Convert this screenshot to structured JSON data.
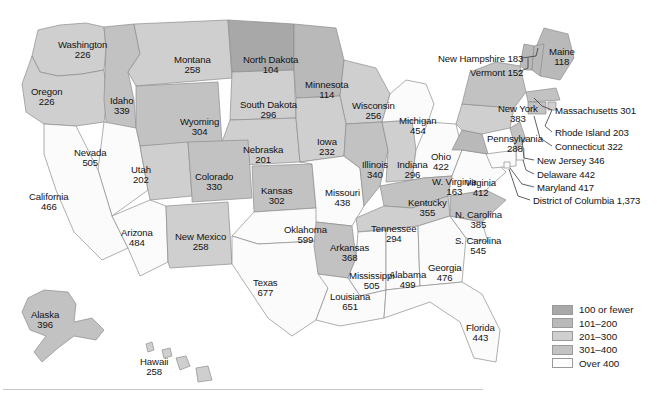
{
  "map": {
    "title": "United States choropleth map of state values",
    "bands": {
      "b1": {
        "key": "b1",
        "label": "100 or fewer",
        "color": "#a8a8a8"
      },
      "b2": {
        "key": "b2",
        "label": "101–200",
        "color": "#b9b9b9"
      },
      "b3": {
        "key": "b3",
        "label": "201–300",
        "color": "#cfcfcf"
      },
      "b4": {
        "key": "b4",
        "label": "301–400",
        "color": "#c2c2c2"
      },
      "b5": {
        "key": "b5",
        "label": "Over 400",
        "color": "#fdfdfd"
      }
    },
    "states": [
      {
        "id": "WA",
        "name": "Washington",
        "value": "226",
        "band": "b3",
        "x": 58,
        "y": 40
      },
      {
        "id": "OR",
        "name": "Oregon",
        "value": "226",
        "band": "b3",
        "x": 31,
        "y": 87
      },
      {
        "id": "ID",
        "name": "Idaho",
        "value": "339",
        "band": "b4",
        "x": 110,
        "y": 96
      },
      {
        "id": "MT",
        "name": "Montana",
        "value": "258",
        "band": "b3",
        "x": 174,
        "y": 55
      },
      {
        "id": "WY",
        "name": "Wyoming",
        "value": "304",
        "band": "b4",
        "x": 180,
        "y": 117
      },
      {
        "id": "ND",
        "name": "North Dakota",
        "value": "104",
        "band": "b1",
        "x": 243,
        "y": 55
      },
      {
        "id": "SD",
        "name": "South Dakota",
        "value": "296",
        "band": "b3",
        "x": 240,
        "y": 100
      },
      {
        "id": "NE",
        "name": "Nebraska",
        "value": "201",
        "band": "b3",
        "x": 243,
        "y": 145
      },
      {
        "id": "MN",
        "name": "Minnesota",
        "value": "114",
        "band": "b2",
        "x": 305,
        "y": 80
      },
      {
        "id": "WI",
        "name": "Wisconsin",
        "value": "256",
        "band": "b3",
        "x": 352,
        "y": 101
      },
      {
        "id": "IA",
        "name": "Iowa",
        "value": "232",
        "band": "b3",
        "x": 317,
        "y": 137
      },
      {
        "id": "NV",
        "name": "Nevada",
        "value": "505",
        "band": "b5",
        "x": 74,
        "y": 148
      },
      {
        "id": "UT",
        "name": "Utah",
        "value": "202",
        "band": "b3",
        "x": 131,
        "y": 165
      },
      {
        "id": "CO",
        "name": "Colorado",
        "value": "330",
        "band": "b4",
        "x": 195,
        "y": 172
      },
      {
        "id": "KS",
        "name": "Kansas",
        "value": "302",
        "band": "b4",
        "x": 261,
        "y": 186
      },
      {
        "id": "CA",
        "name": "California",
        "value": "466",
        "band": "b5",
        "x": 29,
        "y": 192
      },
      {
        "id": "AZ",
        "name": "Arizona",
        "value": "484",
        "band": "b5",
        "x": 121,
        "y": 228
      },
      {
        "id": "NM",
        "name": "New Mexico",
        "value": "258",
        "band": "b3",
        "x": 175,
        "y": 232
      },
      {
        "id": "OK",
        "name": "Oklahoma",
        "value": "599",
        "band": "b5",
        "x": 284,
        "y": 225
      },
      {
        "id": "TX",
        "name": "Texas",
        "value": "677",
        "band": "b5",
        "x": 253,
        "y": 278
      },
      {
        "id": "MO",
        "name": "Missouri",
        "value": "438",
        "band": "b5",
        "x": 325,
        "y": 188
      },
      {
        "id": "IL",
        "name": "Illinois",
        "value": "340",
        "band": "b4",
        "x": 362,
        "y": 160
      },
      {
        "id": "IN",
        "name": "Indiana",
        "value": "296",
        "band": "b3",
        "x": 397,
        "y": 160
      },
      {
        "id": "MI",
        "name": "Michigan",
        "value": "454",
        "band": "b5",
        "x": 399,
        "y": 116
      },
      {
        "id": "OH",
        "name": "Ohio",
        "value": "422",
        "band": "b5",
        "x": 431,
        "y": 152
      },
      {
        "id": "AR",
        "name": "Arkansas",
        "value": "368",
        "band": "b4",
        "x": 330,
        "y": 243
      },
      {
        "id": "KY",
        "name": "Kentucky",
        "value": "355",
        "band": "b4",
        "x": 408,
        "y": 198
      },
      {
        "id": "TN",
        "name": "Tennessee",
        "value": "294",
        "band": "b3",
        "x": 371,
        "y": 224
      },
      {
        "id": "MS",
        "name": "Mississippi",
        "value": "505",
        "band": "b5",
        "x": 349,
        "y": 271
      },
      {
        "id": "AL",
        "name": "Alabama",
        "value": "499",
        "band": "b5",
        "x": 389,
        "y": 270
      },
      {
        "id": "LA",
        "name": "Louisiana",
        "value": "651",
        "band": "b5",
        "x": 330,
        "y": 292
      },
      {
        "id": "GA",
        "name": "Georgia",
        "value": "476",
        "band": "b5",
        "x": 428,
        "y": 263
      },
      {
        "id": "FL",
        "name": "Florida",
        "value": "443",
        "band": "b5",
        "x": 466,
        "y": 323
      },
      {
        "id": "SC",
        "name": "S. Carolina",
        "value": "545",
        "band": "b5",
        "x": 455,
        "y": 236
      },
      {
        "id": "NC",
        "name": "N. Carolina",
        "value": "385",
        "band": "b4",
        "x": 455,
        "y": 210
      },
      {
        "id": "VA",
        "name": "Virginia",
        "value": "412",
        "band": "b5",
        "x": 465,
        "y": 178
      },
      {
        "id": "WV",
        "name": "W. Virginia",
        "value": "163",
        "band": "b2",
        "x": 432,
        "y": 177
      },
      {
        "id": "PA",
        "name": "Pennsylvania",
        "value": "288",
        "band": "b3",
        "x": 487,
        "y": 134
      },
      {
        "id": "NY",
        "name": "New York",
        "value": "383",
        "band": "b4",
        "x": 498,
        "y": 104
      },
      {
        "id": "ME",
        "name": "Maine",
        "value": "118",
        "band": "b2",
        "x": 549,
        "y": 47
      },
      {
        "id": "AK",
        "name": "Alaska",
        "value": "396",
        "band": "b4",
        "x": 31,
        "y": 310
      },
      {
        "id": "HI",
        "name": "Hawaii",
        "value": "258",
        "band": "b3",
        "x": 140,
        "y": 357
      }
    ],
    "callouts": [
      {
        "id": "NH",
        "name": "New Hampshire",
        "value": "183",
        "band": "b2",
        "x": 438,
        "y": 54
      },
      {
        "id": "VT",
        "name": "Vermont",
        "value": "152",
        "band": "b2",
        "x": 470,
        "y": 68
      },
      {
        "id": "MA",
        "name": "Massachusetts",
        "value": "301",
        "band": "b4",
        "x": 555,
        "y": 106
      },
      {
        "id": "RI",
        "name": "Rhode Island",
        "value": "203",
        "band": "b3",
        "x": 555,
        "y": 128
      },
      {
        "id": "CT",
        "name": "Connecticut",
        "value": "322",
        "band": "b4",
        "x": 555,
        "y": 142
      },
      {
        "id": "NJ",
        "name": "New Jersey",
        "value": "346",
        "band": "b4",
        "x": 537,
        "y": 156
      },
      {
        "id": "DE",
        "name": "Delaware",
        "value": "442",
        "band": "b5",
        "x": 537,
        "y": 170
      },
      {
        "id": "MD",
        "name": "Maryland",
        "value": "417",
        "band": "b5",
        "x": 537,
        "y": 183
      },
      {
        "id": "DC",
        "name": "District of Columbia",
        "value": "1,373",
        "band": "b5",
        "x": 533,
        "y": 196
      }
    ]
  },
  "legend": {
    "name": "map-legend",
    "rows": [
      {
        "band": "b1",
        "label": "100 or fewer"
      },
      {
        "band": "b2",
        "label": "101–200"
      },
      {
        "band": "b3",
        "label": "201–300"
      },
      {
        "band": "b4",
        "label": "301–400"
      },
      {
        "band": "b5",
        "label": "Over 400"
      }
    ]
  },
  "chart_data": {
    "type": "map",
    "legend_position": "bottom-right",
    "scale_type": "categorical-choropleth",
    "bins": [
      "100 or fewer",
      "101–200",
      "201–300",
      "301–400",
      "Over 400"
    ],
    "categories": [
      "Washington",
      "Oregon",
      "Idaho",
      "Montana",
      "Wyoming",
      "North Dakota",
      "South Dakota",
      "Nebraska",
      "Minnesota",
      "Wisconsin",
      "Iowa",
      "Nevada",
      "Utah",
      "Colorado",
      "Kansas",
      "California",
      "Arizona",
      "New Mexico",
      "Oklahoma",
      "Texas",
      "Missouri",
      "Illinois",
      "Indiana",
      "Michigan",
      "Ohio",
      "Arkansas",
      "Kentucky",
      "Tennessee",
      "Mississippi",
      "Alabama",
      "Louisiana",
      "Georgia",
      "Florida",
      "S. Carolina",
      "N. Carolina",
      "Virginia",
      "W. Virginia",
      "Pennsylvania",
      "New York",
      "Maine",
      "Alaska",
      "Hawaii",
      "New Hampshire",
      "Vermont",
      "Massachusetts",
      "Rhode Island",
      "Connecticut",
      "New Jersey",
      "Delaware",
      "Maryland",
      "District of Columbia"
    ],
    "values": [
      226,
      226,
      339,
      258,
      304,
      104,
      296,
      201,
      114,
      256,
      232,
      505,
      202,
      330,
      302,
      466,
      484,
      258,
      599,
      677,
      438,
      340,
      296,
      454,
      422,
      368,
      355,
      294,
      505,
      499,
      651,
      476,
      443,
      545,
      385,
      412,
      163,
      288,
      383,
      118,
      396,
      258,
      183,
      152,
      301,
      203,
      322,
      346,
      442,
      417,
      1373
    ]
  }
}
